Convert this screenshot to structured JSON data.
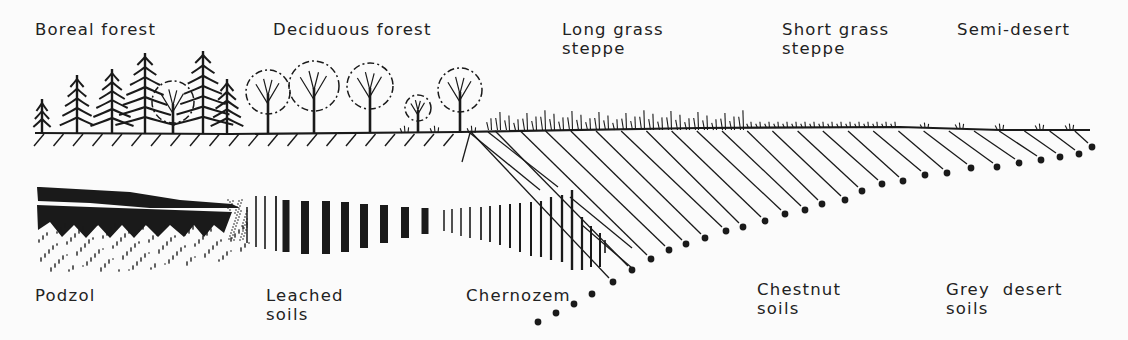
{
  "vegetation_zones": [
    {
      "id": "boreal",
      "label": "Boreal forest"
    },
    {
      "id": "deciduous",
      "label": "Deciduous forest"
    },
    {
      "id": "long-grass",
      "label": "Long grass\nsteppe"
    },
    {
      "id": "short-grass",
      "label": "Short grass\nsteppe"
    },
    {
      "id": "semi-desert",
      "label": "Semi-desert"
    }
  ],
  "soil_types": [
    {
      "id": "podzol",
      "label": "Podzol"
    },
    {
      "id": "leached",
      "label": "Leached\nsoils"
    },
    {
      "id": "chernozem",
      "label": "Chernozem"
    },
    {
      "id": "chestnut",
      "label": "Chestnut\nsoils"
    },
    {
      "id": "grey-desert",
      "label": "Grey  desert\nsoils"
    }
  ],
  "colors": {
    "ink": "#1a1a1a",
    "paper": "#fbfbfb"
  }
}
